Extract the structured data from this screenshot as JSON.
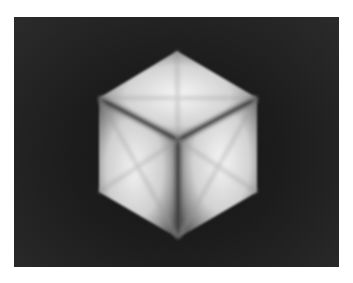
{
  "image": {
    "subject": "shaded cube",
    "background_color": "#ffffff",
    "frame_color_edge": "#2b2b2b",
    "frame_color_center": "#141414",
    "face_highlight": "#f4f4f4",
    "edge_shadow": "#3a3a3a"
  }
}
